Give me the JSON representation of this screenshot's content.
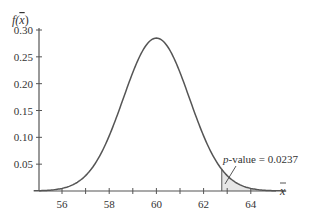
{
  "chart_data": {
    "type": "area",
    "title": "",
    "xlabel": "x̄",
    "ylabel": "f(x̄)",
    "distribution": {
      "kind": "normal",
      "mean": 60,
      "std_error": 1.4
    },
    "xlim": [
      54.8,
      65.5
    ],
    "ylim": [
      0,
      0.3
    ],
    "x_ticks": [
      56,
      57,
      58,
      59,
      60,
      61,
      62,
      63,
      64
    ],
    "x_tick_labels": [
      "56",
      "58",
      "60",
      "62",
      "64"
    ],
    "y_ticks": [
      0.05,
      0.1,
      0.15,
      0.2,
      0.25,
      0.3
    ],
    "y_tick_labels": [
      "0.05",
      "0.10",
      "0.15",
      "0.20",
      "0.25",
      "0.30"
    ],
    "shaded_region": {
      "from": 62.77,
      "to": 65.5,
      "tail": "upper"
    },
    "annotations": [
      {
        "text": "p-value = 0.0237",
        "points_to": "shaded upper tail"
      }
    ],
    "grid": false,
    "legend": null
  },
  "labels": {
    "y_axis_title_f": "f(",
    "y_axis_title_x": "x",
    "y_axis_title_close": ")",
    "x_axis_title": "x",
    "annotation_p": "p",
    "annotation_rest": "-value = 0.0237"
  },
  "colors": {
    "curve": "#555555",
    "axis": "#555555",
    "shade": "#e6e6e6",
    "text": "#333333"
  }
}
